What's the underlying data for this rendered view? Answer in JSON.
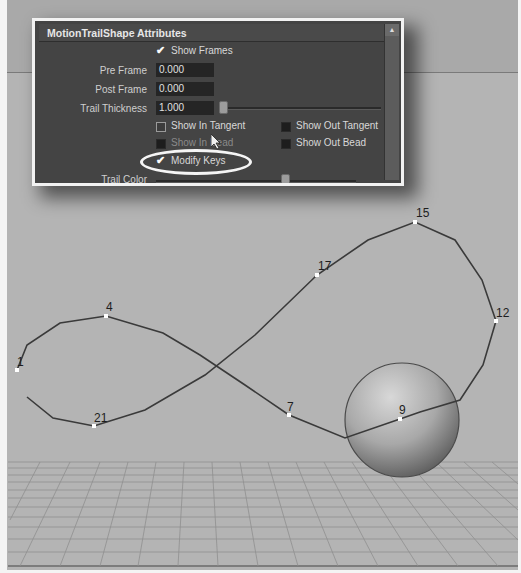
{
  "panel": {
    "title": "MotionTrailShape Attributes",
    "show_frames": {
      "label": "Show Frames",
      "checked": true
    },
    "pre_frame": {
      "label": "Pre Frame",
      "value": "0.000"
    },
    "post_frame": {
      "label": "Post Frame",
      "value": "0.000"
    },
    "trail_thickness": {
      "label": "Trail Thickness",
      "value": "1.000"
    },
    "show_in_tangent": {
      "label": "Show In Tangent",
      "checked": false
    },
    "show_out_tangent": {
      "label": "Show Out Tangent",
      "checked": false
    },
    "show_in_bead": {
      "label": "Show In Bead",
      "checked": false
    },
    "show_out_bead": {
      "label": "Show Out Bead",
      "checked": false
    },
    "modify_keys": {
      "label": "Modify Keys",
      "checked": true
    },
    "trail_color": {
      "label": "Trail Color"
    },
    "scroll_up_icon": "▲"
  },
  "viewport": {
    "frame_markers": [
      {
        "label": "1",
        "x": 17,
        "y": 370
      },
      {
        "label": "4",
        "x": 106,
        "y": 316
      },
      {
        "label": "21",
        "x": 94,
        "y": 426
      },
      {
        "label": "7",
        "x": 289,
        "y": 415
      },
      {
        "label": "9",
        "x": 400,
        "y": 419
      },
      {
        "label": "12",
        "x": 496,
        "y": 321
      },
      {
        "label": "15",
        "x": 415,
        "y": 222
      },
      {
        "label": "17",
        "x": 317,
        "y": 275
      }
    ],
    "sphere": {
      "cx": 402,
      "cy": 420,
      "r": 57
    }
  }
}
